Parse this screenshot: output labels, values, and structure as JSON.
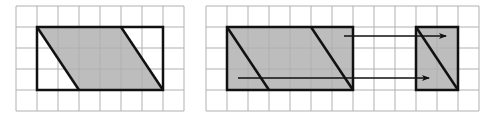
{
  "colors": {
    "grid": "#b0b0b0",
    "outline": "#111111",
    "fill": "#bdbdbd",
    "background": "#ffffff"
  },
  "figures": [
    {
      "name": "parallelogram-in-rectangle",
      "grid": {
        "cols": 8,
        "rows": 5
      },
      "rectangle": {
        "col": 1,
        "row": 1,
        "width": 6,
        "height": 3
      },
      "parallelogram": {
        "top_left": 0,
        "top_right": 4,
        "bottom_left": 2,
        "bottom_right": 6
      }
    },
    {
      "name": "cut-and-translate",
      "grid": {
        "cols": 13,
        "rows": 5
      },
      "rectangle": {
        "col": 1,
        "row": 1,
        "width": 6,
        "height": 3
      },
      "moved_piece": {
        "col": 10,
        "row": 1,
        "width": 2,
        "height": 3
      },
      "arrows": 2
    }
  ]
}
